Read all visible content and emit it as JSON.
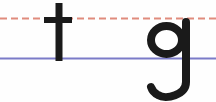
{
  "image": {
    "kind": "handwriting-practice-line",
    "description": "Lowercase letters t and g drawn on a ruled handwriting guide",
    "width": 216,
    "height": 102,
    "background_color": "#fefefe"
  },
  "guides": [
    {
      "name": "midline-dashed",
      "style": "dashed",
      "color": "#e08b7d",
      "y": 18,
      "thickness": 2,
      "dash_length": 7,
      "gap_length": 4
    },
    {
      "name": "baseline-solid",
      "style": "solid",
      "color": "#7b7bc8",
      "y": 58,
      "thickness": 2,
      "dash_length": 0,
      "gap_length": 0
    }
  ],
  "letters": [
    {
      "name": "letter-t",
      "character": "t",
      "color": "#1a1a1a",
      "stroke_width": 7,
      "ascender_top": 3,
      "baseline": 61,
      "crossbar_y": 20,
      "crossbar_left": 44,
      "crossbar_right": 72,
      "stem_x": 59
    },
    {
      "name": "letter-g",
      "character": "g",
      "color": "#1a1a1a",
      "stroke_width": 8,
      "bowl_top": 22,
      "bowl_bottom": 58,
      "bowl_left": 147,
      "bowl_right": 186,
      "stem_x": 186,
      "descender_bottom": 99,
      "hook_left": 152
    }
  ],
  "colors": {
    "ink": "#1a1a1a",
    "midline": "#e08b7d",
    "baseline": "#7b7bc8",
    "paper": "#fefefe"
  }
}
